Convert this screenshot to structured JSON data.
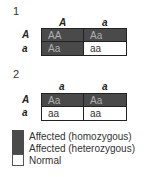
{
  "panels": [
    {
      "label": "1",
      "col_headers": [
        "A",
        "a"
      ],
      "row_headers": [
        "A",
        "a"
      ],
      "cells": [
        [
          {
            "text": "AA",
            "status": "homozygous"
          },
          {
            "text": "Aa",
            "status": "heterozygous"
          }
        ],
        [
          {
            "text": "Aa",
            "status": "heterozygous"
          },
          {
            "text": "aa",
            "status": "normal"
          }
        ]
      ]
    },
    {
      "label": "2",
      "col_headers": [
        "a",
        "a"
      ],
      "row_headers": [
        "A",
        "a"
      ],
      "cells": [
        [
          {
            "text": "Aa",
            "status": "heterozygous"
          },
          {
            "text": "Aa",
            "status": "heterozygous"
          }
        ],
        [
          {
            "text": "aa",
            "status": "normal"
          },
          {
            "text": "aa",
            "status": "normal"
          }
        ]
      ]
    }
  ],
  "legend": [
    {
      "label": "Affected (homozygous)",
      "color": "#4a4a4a"
    },
    {
      "label": "Affected (heterozygous)",
      "color": "#4a4a4a"
    },
    {
      "label": "Normal",
      "color": "#ffffff"
    }
  ]
}
